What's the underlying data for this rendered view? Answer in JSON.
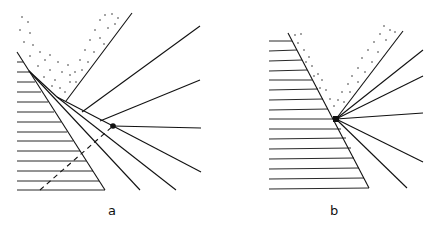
{
  "panels": [
    {
      "id": "a",
      "label": "a"
    },
    {
      "id": "b",
      "label": "b"
    }
  ],
  "colors": {
    "ink": "#111111",
    "background": "#ffffff"
  }
}
